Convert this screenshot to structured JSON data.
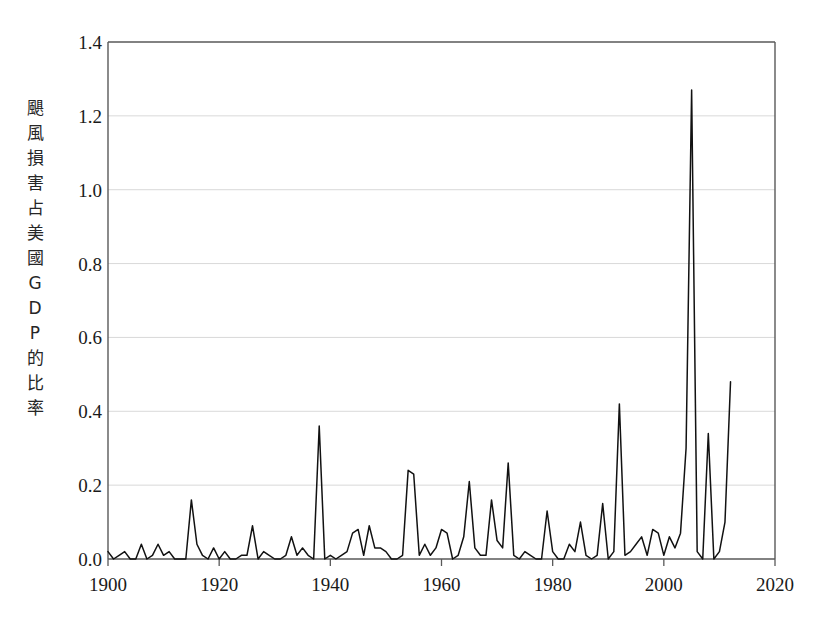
{
  "chart_data": {
    "type": "line",
    "title": "",
    "xlabel": "",
    "ylabel": "颶風損害占美國GDP的比率",
    "ylabel_chars": [
      "颶",
      "風",
      "損",
      "害",
      "占",
      "美",
      "國",
      "G",
      "D",
      "P",
      "的",
      "比",
      "率"
    ],
    "xlim": [
      1900,
      2020
    ],
    "ylim": [
      0.0,
      1.4
    ],
    "xticks": [
      1900,
      1920,
      1940,
      1960,
      1980,
      2000,
      2020
    ],
    "xtick_labels": [
      "1900",
      "1920",
      "1940",
      "1960",
      "1980",
      "2000",
      "2020"
    ],
    "yticks": [
      0.0,
      0.2,
      0.4,
      0.6,
      0.8,
      1.0,
      1.2,
      1.4
    ],
    "ytick_labels": [
      "0.0",
      "0.2",
      "0.4",
      "0.6",
      "0.8",
      "1.0",
      "1.2",
      "1.4"
    ],
    "grid": "horizontal",
    "legend": null,
    "line_color": "#111111",
    "grid_color": "#d9d9d9",
    "axis_color": "#595959",
    "background_color": "#ffffff",
    "series": [
      {
        "name": "颶風損害占美國GDP的比率",
        "x": [
          1900,
          1901,
          1902,
          1903,
          1904,
          1905,
          1906,
          1907,
          1908,
          1909,
          1910,
          1911,
          1912,
          1913,
          1914,
          1915,
          1916,
          1917,
          1918,
          1919,
          1920,
          1921,
          1922,
          1923,
          1924,
          1925,
          1926,
          1927,
          1928,
          1929,
          1930,
          1931,
          1932,
          1933,
          1934,
          1935,
          1936,
          1937,
          1938,
          1939,
          1940,
          1941,
          1942,
          1943,
          1944,
          1945,
          1946,
          1947,
          1948,
          1949,
          1950,
          1951,
          1952,
          1953,
          1954,
          1955,
          1956,
          1957,
          1958,
          1959,
          1960,
          1961,
          1962,
          1963,
          1964,
          1965,
          1966,
          1967,
          1968,
          1969,
          1970,
          1971,
          1972,
          1973,
          1974,
          1975,
          1976,
          1977,
          1978,
          1979,
          1980,
          1981,
          1982,
          1983,
          1984,
          1985,
          1986,
          1987,
          1988,
          1989,
          1990,
          1991,
          1992,
          1993,
          1994,
          1995,
          1996,
          1997,
          1998,
          1999,
          2000,
          2001,
          2002,
          2003,
          2004,
          2005,
          2006,
          2007,
          2008,
          2009,
          2010,
          2011,
          2012
        ],
        "values": [
          0.02,
          0.0,
          0.01,
          0.02,
          0.0,
          0.0,
          0.04,
          0.0,
          0.01,
          0.04,
          0.01,
          0.02,
          0.0,
          0.0,
          0.0,
          0.16,
          0.04,
          0.01,
          0.0,
          0.03,
          0.0,
          0.02,
          0.0,
          0.0,
          0.01,
          0.01,
          0.09,
          0.0,
          0.02,
          0.01,
          0.0,
          0.0,
          0.01,
          0.06,
          0.01,
          0.03,
          0.01,
          0.0,
          0.36,
          0.0,
          0.01,
          0.0,
          0.01,
          0.02,
          0.07,
          0.08,
          0.01,
          0.09,
          0.03,
          0.03,
          0.02,
          0.0,
          0.0,
          0.01,
          0.24,
          0.23,
          0.01,
          0.04,
          0.01,
          0.03,
          0.08,
          0.07,
          0.0,
          0.01,
          0.06,
          0.21,
          0.03,
          0.01,
          0.01,
          0.16,
          0.05,
          0.03,
          0.26,
          0.01,
          0.0,
          0.02,
          0.01,
          0.0,
          0.0,
          0.13,
          0.02,
          0.0,
          0.0,
          0.04,
          0.02,
          0.1,
          0.01,
          0.0,
          0.01,
          0.15,
          0.0,
          0.02,
          0.42,
          0.01,
          0.02,
          0.04,
          0.06,
          0.01,
          0.08,
          0.07,
          0.01,
          0.06,
          0.03,
          0.07,
          0.3,
          1.27,
          0.02,
          0.0,
          0.34,
          0.0,
          0.02,
          0.1,
          0.48
        ]
      }
    ]
  },
  "axes": {
    "plot_left": 108,
    "plot_right": 775,
    "plot_top": 42,
    "plot_bottom": 559
  }
}
